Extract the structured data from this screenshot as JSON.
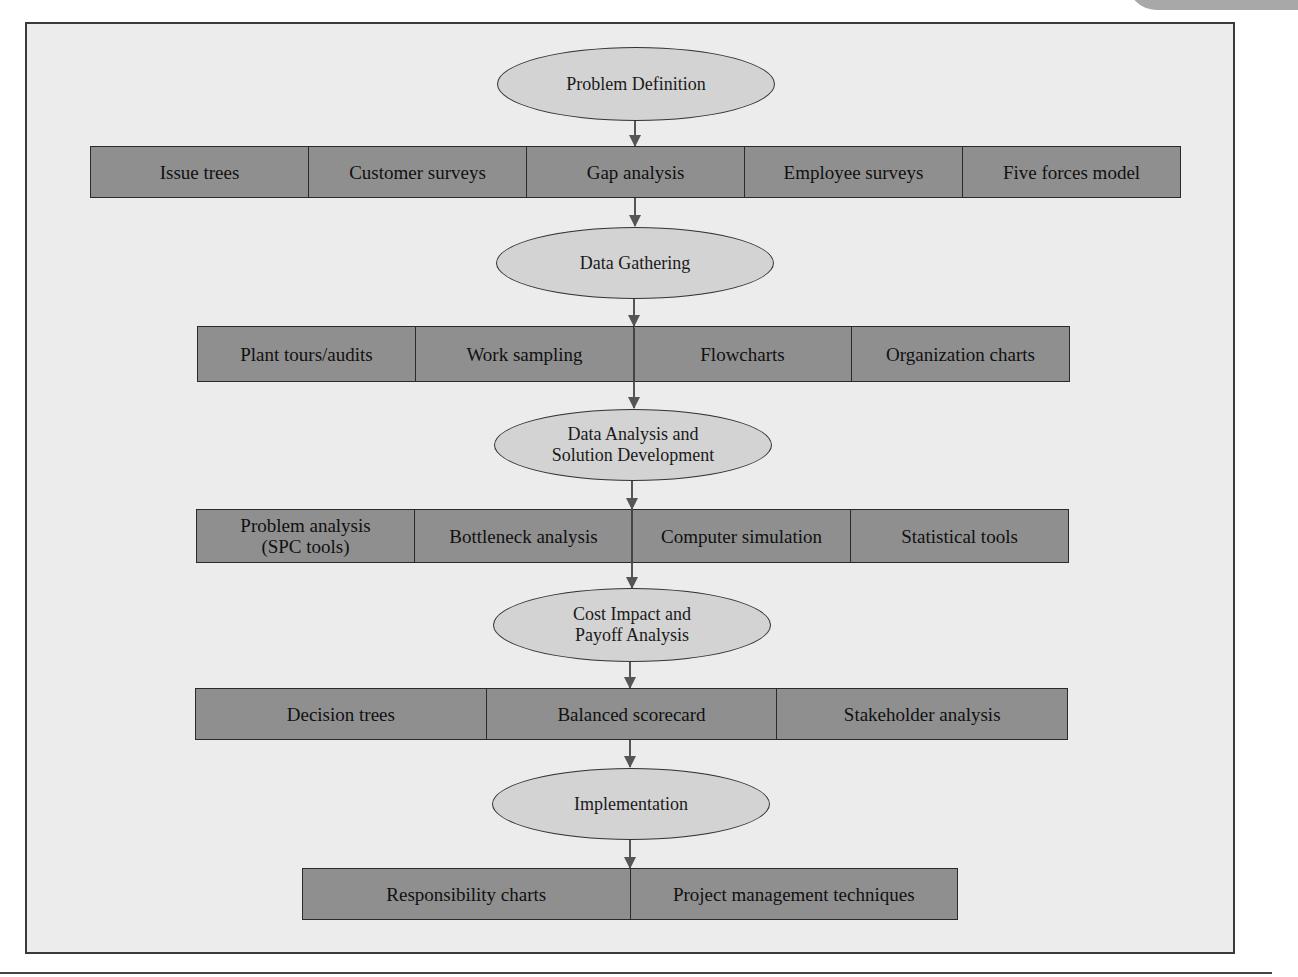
{
  "diagram": {
    "type": "flowchart",
    "direction": "top-to-bottom",
    "stages": [
      {
        "name": "Problem Definition",
        "tools": [
          "Issue trees",
          "Customer surveys",
          "Gap analysis",
          "Employee surveys",
          "Five forces model"
        ]
      },
      {
        "name": "Data Gathering",
        "tools": [
          "Plant tours/audits",
          "Work sampling",
          "Flowcharts",
          "Organization charts"
        ]
      },
      {
        "name": "Data Analysis and\nSolution Development",
        "tools": [
          "Problem analysis\n(SPC tools)",
          "Bottleneck analysis",
          "Computer simulation",
          "Statistical tools"
        ]
      },
      {
        "name": "Cost Impact and\nPayoff Analysis",
        "tools": [
          "Decision trees",
          "Balanced scorecard",
          "Stakeholder analysis"
        ]
      },
      {
        "name": "Implementation",
        "tools": [
          "Responsibility charts",
          "Project management techniques"
        ]
      }
    ]
  },
  "colors": {
    "background": "#ececec",
    "ellipse_fill": "#d3d3d3",
    "tool_box_fill": "#8f8f8f",
    "border": "#2a2a2a",
    "arrow": "#555555"
  }
}
